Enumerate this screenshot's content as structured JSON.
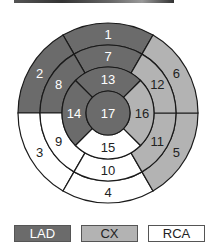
{
  "diagram": {
    "colors": {
      "LAD": "#6b6b6b",
      "CX": "#b3b3b3",
      "RCA": "#ffffff",
      "stroke": "#1a1a1a"
    },
    "segments": [
      {
        "id": "1",
        "label": "1",
        "territory": "LAD"
      },
      {
        "id": "2",
        "label": "2",
        "territory": "LAD"
      },
      {
        "id": "3",
        "label": "3",
        "territory": "RCA"
      },
      {
        "id": "4",
        "label": "4",
        "territory": "RCA"
      },
      {
        "id": "5",
        "label": "5",
        "territory": "CX"
      },
      {
        "id": "6",
        "label": "6",
        "territory": "CX"
      },
      {
        "id": "7",
        "label": "7",
        "territory": "LAD"
      },
      {
        "id": "8",
        "label": "8",
        "territory": "LAD"
      },
      {
        "id": "9",
        "label": "9",
        "territory": "RCA"
      },
      {
        "id": "10",
        "label": "10",
        "territory": "RCA"
      },
      {
        "id": "11",
        "label": "11",
        "territory": "CX"
      },
      {
        "id": "12",
        "label": "12",
        "territory": "CX"
      },
      {
        "id": "13",
        "label": "13",
        "territory": "LAD"
      },
      {
        "id": "14",
        "label": "14",
        "territory": "LAD"
      },
      {
        "id": "15",
        "label": "15",
        "territory": "RCA"
      },
      {
        "id": "16",
        "label": "16",
        "territory": "CX"
      },
      {
        "id": "17",
        "label": "17",
        "territory": "LAD"
      }
    ]
  },
  "legend": {
    "items": [
      {
        "label": "LAD",
        "color": "#6b6b6b",
        "text_color": "#ffffff"
      },
      {
        "label": "CX",
        "color": "#b3b3b3",
        "text_color": "#222222"
      },
      {
        "label": "RCA",
        "color": "#ffffff",
        "text_color": "#222222"
      }
    ]
  }
}
